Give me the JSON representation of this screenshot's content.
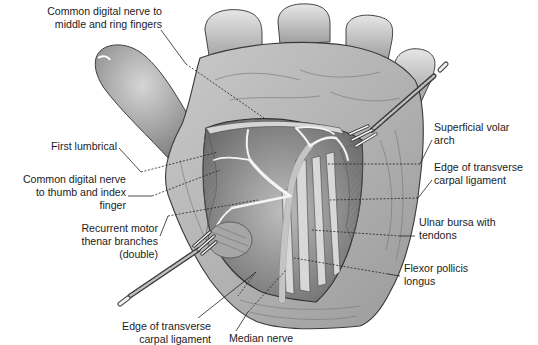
{
  "figure": {
    "retractors": 2
  },
  "labels": [
    {
      "id": "common-digital-nerve-middle-ring",
      "text": "Common digital nerve to\nmiddle and ring fingers",
      "side": "left"
    },
    {
      "id": "first-lumbrical",
      "text": "First lumbrical",
      "side": "left"
    },
    {
      "id": "common-digital-nerve-thumb-index",
      "text": "Common digital nerve\nto thumb and index\nfinger",
      "side": "left"
    },
    {
      "id": "recurrent-motor-thenar-branches",
      "text": "Recurrent motor\nthenar branches\n(double)",
      "side": "left"
    },
    {
      "id": "edge-transverse-carpal-ligament-bottom",
      "text": "Edge of transverse\ncarpal ligament",
      "side": "bottom"
    },
    {
      "id": "median-nerve",
      "text": "Median nerve",
      "side": "bottom"
    },
    {
      "id": "superficial-volar-arch",
      "text": "Superficial volar\narch",
      "side": "right"
    },
    {
      "id": "edge-transverse-carpal-ligament-right",
      "text": "Edge of transverse\ncarpal ligament",
      "side": "right"
    },
    {
      "id": "ulnar-bursa-with-tendons",
      "text": "Ulnar bursa with\ntendons",
      "side": "right"
    },
    {
      "id": "flexor-pollicis-longus",
      "text": "Flexor pollicis\nlongus",
      "side": "right"
    }
  ],
  "colors": {
    "background": "#ffffff",
    "ink": "#1c1c1c",
    "skin_light": "#d9d9d9",
    "skin_mid": "#a8a8a8",
    "skin_dark": "#5a5a5a",
    "tissue_light": "#eeeeee"
  }
}
